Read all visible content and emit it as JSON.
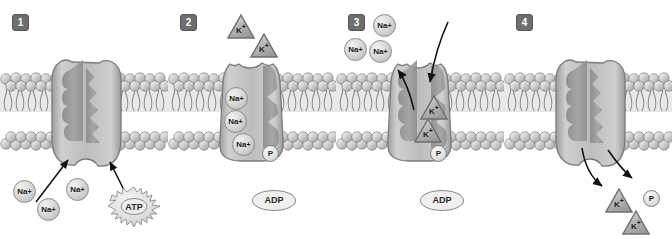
{
  "figure": {
    "type": "diagram",
    "panel_count": 4,
    "colors": {
      "background": "#ffffff",
      "badge_fill": "#6e6e6e",
      "badge_text": "#ffffff",
      "membrane_head": "#c9c9c9",
      "membrane_tail": "#9a9a9a",
      "pump_light": "#c6c6c6",
      "pump_mid": "#a8a8a8",
      "pump_dark": "#8f8f8f",
      "ion_fill": "#d8d8d8",
      "ion_text": "#1c1c1c",
      "arrow": "#111111"
    }
  },
  "panels": [
    {
      "number": "1",
      "na_ions": [
        {
          "label": "Na",
          "charge": "+"
        },
        {
          "label": "Na",
          "charge": "+"
        },
        {
          "label": "Na",
          "charge": "+"
        }
      ],
      "atp": {
        "label": "ATP"
      },
      "arrows": [
        {
          "name": "na-binding-arrow"
        },
        {
          "name": "atp-binding-arrow"
        }
      ]
    },
    {
      "number": "2",
      "k_ions": [
        {
          "label": "K",
          "charge": "+"
        },
        {
          "label": "K",
          "charge": "+"
        }
      ],
      "na_ions_bound": [
        {
          "label": "Na",
          "charge": "+"
        },
        {
          "label": "Na",
          "charge": "+"
        },
        {
          "label": "Na",
          "charge": "+"
        }
      ],
      "phosphate": {
        "label": "P"
      },
      "adp": {
        "label": "ADP"
      }
    },
    {
      "number": "3",
      "na_ions_released": [
        {
          "label": "Na",
          "charge": "+"
        },
        {
          "label": "Na",
          "charge": "+"
        },
        {
          "label": "Na",
          "charge": "+"
        }
      ],
      "k_ions_bound": [
        {
          "label": "K",
          "charge": "+"
        },
        {
          "label": "K",
          "charge": "+"
        }
      ],
      "phosphate": {
        "label": "P"
      },
      "adp": {
        "label": "ADP"
      },
      "arrows": [
        {
          "name": "na-release-arrow"
        },
        {
          "name": "k-entry-arrow"
        }
      ]
    },
    {
      "number": "4",
      "k_ions_released": [
        {
          "label": "K",
          "charge": "+"
        },
        {
          "label": "K",
          "charge": "+"
        }
      ],
      "phosphate": {
        "label": "P"
      },
      "arrows": [
        {
          "name": "k-release-arrow"
        },
        {
          "name": "phosphate-release-arrow"
        }
      ]
    }
  ]
}
